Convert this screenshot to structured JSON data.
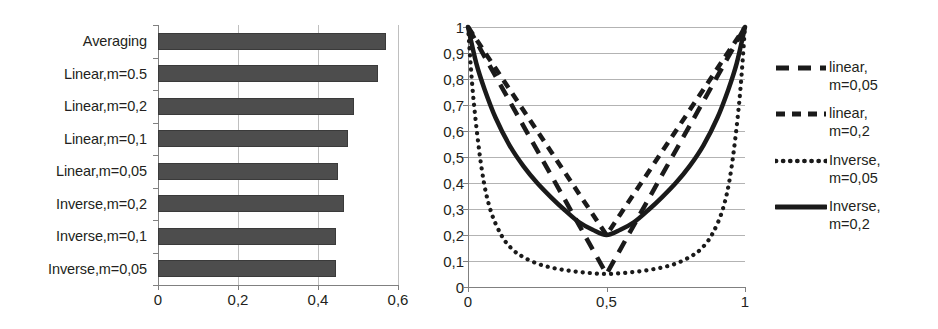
{
  "chart_data": [
    {
      "type": "bar",
      "orientation": "horizontal",
      "title": "",
      "xlabel": "",
      "ylabel": "",
      "xlim": [
        0,
        0.6
      ],
      "grid": true,
      "categories": [
        "Averaging",
        "Linear,m=0.5",
        "Linear,m=0,2",
        "Linear,m=0,1",
        "Linear,m=0,05",
        "Inverse,m=0,2",
        "Inverse,m=0,1",
        "Inverse,m=0,05"
      ],
      "values": [
        0.57,
        0.55,
        0.49,
        0.475,
        0.45,
        0.465,
        0.445,
        0.445
      ],
      "xticks": [
        0,
        0.2,
        0.4,
        0.6
      ],
      "xticklabels": [
        "0",
        "0,2",
        "0,4",
        "0,6"
      ],
      "bar_color": "#4d4d4d"
    },
    {
      "type": "line",
      "title": "",
      "xlabel": "",
      "ylabel": "",
      "xlim": [
        0,
        1
      ],
      "ylim": [
        0,
        1
      ],
      "grid": true,
      "legend_position": "right",
      "xticks": [
        0,
        0.5,
        1
      ],
      "xticklabels": [
        "0",
        "0,5",
        "1"
      ],
      "yticks": [
        0,
        0.1,
        0.2,
        0.3,
        0.4,
        0.5,
        0.6,
        0.7,
        0.8,
        0.9,
        1
      ],
      "yticklabels": [
        "0",
        "0,1",
        "0,2",
        "0,3",
        "0,4",
        "0,5",
        "0,6",
        "0,7",
        "0,8",
        "0,9",
        "1"
      ],
      "series": [
        {
          "name": "linear, m=0,05",
          "style": "dashed-long",
          "x": [
            0,
            0.1,
            0.2,
            0.3,
            0.4,
            0.45,
            0.5,
            0.55,
            0.6,
            0.7,
            0.8,
            0.9,
            1
          ],
          "y": [
            1,
            0.81,
            0.62,
            0.43,
            0.24,
            0.145,
            0.05,
            0.145,
            0.24,
            0.43,
            0.62,
            0.81,
            1
          ]
        },
        {
          "name": "linear, m=0,2",
          "style": "dashed-short",
          "x": [
            0,
            0.1,
            0.2,
            0.3,
            0.4,
            0.45,
            0.5,
            0.55,
            0.6,
            0.7,
            0.8,
            0.9,
            1
          ],
          "y": [
            1,
            0.84,
            0.68,
            0.52,
            0.36,
            0.28,
            0.2,
            0.28,
            0.36,
            0.52,
            0.68,
            0.84,
            1
          ]
        },
        {
          "name": "Inverse, m=0,05",
          "style": "dotted",
          "x": [
            0,
            0.02,
            0.05,
            0.08,
            0.12,
            0.16,
            0.2,
            0.25,
            0.3,
            0.35,
            0.4,
            0.45,
            0.5,
            0.55,
            0.6,
            0.65,
            0.7,
            0.75,
            0.8,
            0.84,
            0.88,
            0.92,
            0.95,
            0.98,
            1
          ],
          "y": [
            1,
            0.72,
            0.45,
            0.3,
            0.2,
            0.145,
            0.115,
            0.09,
            0.075,
            0.065,
            0.058,
            0.053,
            0.05,
            0.053,
            0.058,
            0.065,
            0.075,
            0.09,
            0.115,
            0.145,
            0.2,
            0.3,
            0.45,
            0.72,
            1
          ]
        },
        {
          "name": "Inverse, m=0,2",
          "style": "solid",
          "x": [
            0,
            0.03,
            0.06,
            0.1,
            0.15,
            0.2,
            0.25,
            0.3,
            0.35,
            0.4,
            0.45,
            0.5,
            0.55,
            0.6,
            0.65,
            0.7,
            0.75,
            0.8,
            0.85,
            0.9,
            0.94,
            0.97,
            1
          ],
          "y": [
            1,
            0.86,
            0.76,
            0.65,
            0.545,
            0.465,
            0.4,
            0.345,
            0.295,
            0.25,
            0.22,
            0.2,
            0.22,
            0.25,
            0.295,
            0.345,
            0.4,
            0.465,
            0.545,
            0.65,
            0.76,
            0.86,
            1
          ]
        }
      ]
    }
  ],
  "bar_chart": {
    "categories": [
      {
        "label": "Averaging",
        "value": 0.57
      },
      {
        "label": "Linear,m=0.5",
        "value": 0.55
      },
      {
        "label": "Linear,m=0,2",
        "value": 0.49
      },
      {
        "label": "Linear,m=0,1",
        "value": 0.475
      },
      {
        "label": "Linear,m=0,05",
        "value": 0.45
      },
      {
        "label": "Inverse,m=0,2",
        "value": 0.465
      },
      {
        "label": "Inverse,m=0,1",
        "value": 0.445
      },
      {
        "label": "Inverse,m=0,05",
        "value": 0.445
      }
    ],
    "xticklabels": [
      "0",
      "0,2",
      "0,4",
      "0,6"
    ]
  },
  "line_chart": {
    "yticklabels": [
      "1",
      "0,9",
      "0,8",
      "0,7",
      "0,6",
      "0,5",
      "0,4",
      "0,3",
      "0,2",
      "0,1",
      "0"
    ],
    "xticklabels": [
      "0",
      "0,5",
      "1"
    ],
    "legend": [
      {
        "label": "linear,\nm=0,05",
        "style": "dashed-long"
      },
      {
        "label": "linear,\nm=0,2",
        "style": "dashed-short"
      },
      {
        "label": "Inverse,\nm=0,05",
        "style": "dotted"
      },
      {
        "label": "Inverse,\nm=0,2",
        "style": "solid"
      }
    ]
  },
  "colors": {
    "bar_fill": "#4d4d4d",
    "gridline": "#b3b3b3",
    "axis": "#808080",
    "text": "#231f20",
    "curve": "#1a1a1a"
  }
}
